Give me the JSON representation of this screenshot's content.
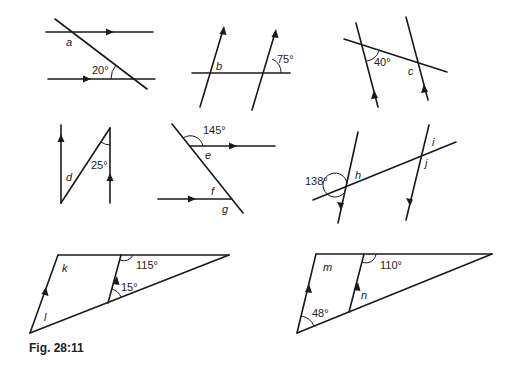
{
  "caption": "Fig. 28:11",
  "figures": [
    {
      "id": "fig-a",
      "unknowns": [
        "a"
      ],
      "given_angles": [
        "20°"
      ]
    },
    {
      "id": "fig-b",
      "unknowns": [
        "b"
      ],
      "given_angles": [
        "75°"
      ]
    },
    {
      "id": "fig-c",
      "unknowns": [
        "c"
      ],
      "given_angles": [
        "40°"
      ]
    },
    {
      "id": "fig-d",
      "unknowns": [
        "d"
      ],
      "given_angles": [
        "25°"
      ]
    },
    {
      "id": "fig-efg",
      "unknowns": [
        "e",
        "f",
        "g"
      ],
      "given_angles": [
        "145°"
      ]
    },
    {
      "id": "fig-hij",
      "unknowns": [
        "h",
        "i",
        "j"
      ],
      "given_angles": [
        "138°"
      ]
    },
    {
      "id": "fig-kl",
      "unknowns": [
        "k",
        "l"
      ],
      "given_angles": [
        "115°",
        "15°"
      ]
    },
    {
      "id": "fig-mn",
      "unknowns": [
        "m",
        "n"
      ],
      "given_angles": [
        "110°",
        "48°"
      ]
    }
  ],
  "labels": {
    "a": "a",
    "b": "b",
    "c": "c",
    "d": "d",
    "e": "e",
    "f": "f",
    "g": "g",
    "h": "h",
    "i": "i",
    "j": "j",
    "k": "k",
    "l": "l",
    "m": "m",
    "n": "n",
    "ang20": "20°",
    "ang75": "75°",
    "ang40": "40°",
    "ang25": "25°",
    "ang145": "145°",
    "ang138": "138°",
    "ang115": "115°",
    "ang15": "15°",
    "ang110": "110°",
    "ang48": "48°"
  }
}
